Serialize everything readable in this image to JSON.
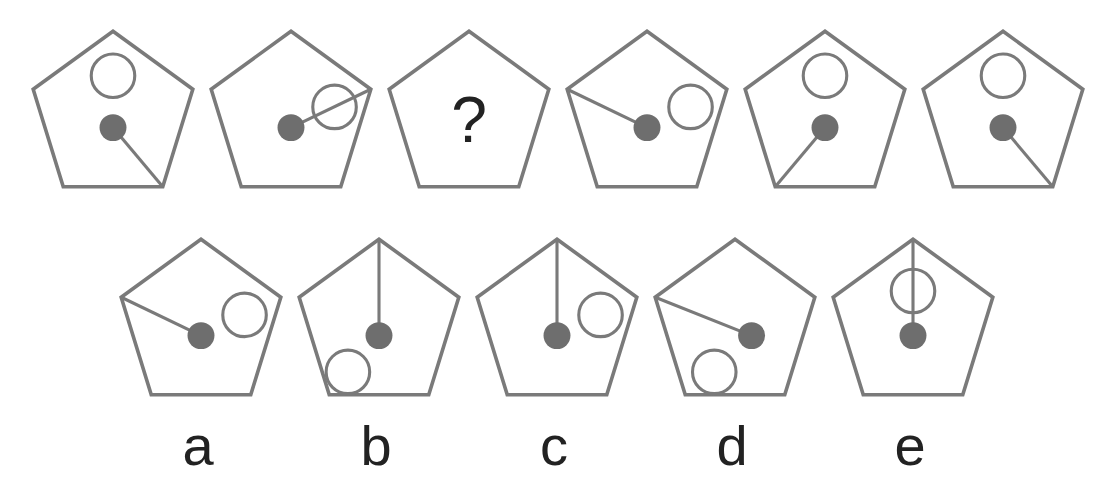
{
  "puzzle": {
    "stroke_color": "#7a7a7a",
    "fill_color": "#6e6e6e",
    "question_mark": "?",
    "sequence": [
      {
        "id": "s1",
        "x": 28,
        "y": 25,
        "dot": [
          82,
          98
        ],
        "line_to": "lower-right",
        "circle": [
          82,
          48
        ]
      },
      {
        "id": "s2",
        "x": 206,
        "y": 25,
        "dot": [
          82,
          98
        ],
        "line_to": "upper-right",
        "circle": [
          124,
          78
        ]
      },
      {
        "id": "s3",
        "x": 384,
        "y": 25,
        "question": true
      },
      {
        "id": "s4",
        "x": 562,
        "y": 25,
        "dot": [
          82,
          98
        ],
        "line_to": "upper-left",
        "circle": [
          124,
          78
        ]
      },
      {
        "id": "s5",
        "x": 740,
        "y": 25,
        "dot": [
          82,
          98
        ],
        "line_to": "lower-left",
        "circle": [
          82,
          48
        ]
      },
      {
        "id": "s6",
        "x": 918,
        "y": 25,
        "dot": [
          82,
          98
        ],
        "line_to": "lower-right",
        "circle": [
          82,
          48
        ]
      }
    ],
    "options": [
      {
        "id": "a",
        "label": "a",
        "x": 116,
        "y": 233,
        "dot": [
          82,
          98
        ],
        "line_to": "upper-left",
        "circle": [
          124,
          78
        ]
      },
      {
        "id": "b",
        "label": "b",
        "x": 294,
        "y": 233,
        "dot": [
          82,
          98
        ],
        "line_to": "top",
        "circle": [
          52,
          133
        ]
      },
      {
        "id": "c",
        "label": "c",
        "x": 472,
        "y": 233,
        "dot": [
          82,
          98
        ],
        "line_to": "top",
        "circle": [
          124,
          78
        ]
      },
      {
        "id": "d",
        "label": "d",
        "x": 650,
        "y": 233,
        "dot": [
          98,
          98
        ],
        "line_to": "upper-left",
        "circle": [
          62,
          133
        ]
      },
      {
        "id": "e",
        "label": "e",
        "x": 828,
        "y": 233,
        "dot": [
          82,
          98
        ],
        "line_to": "top",
        "circle": [
          82,
          55
        ]
      }
    ]
  }
}
